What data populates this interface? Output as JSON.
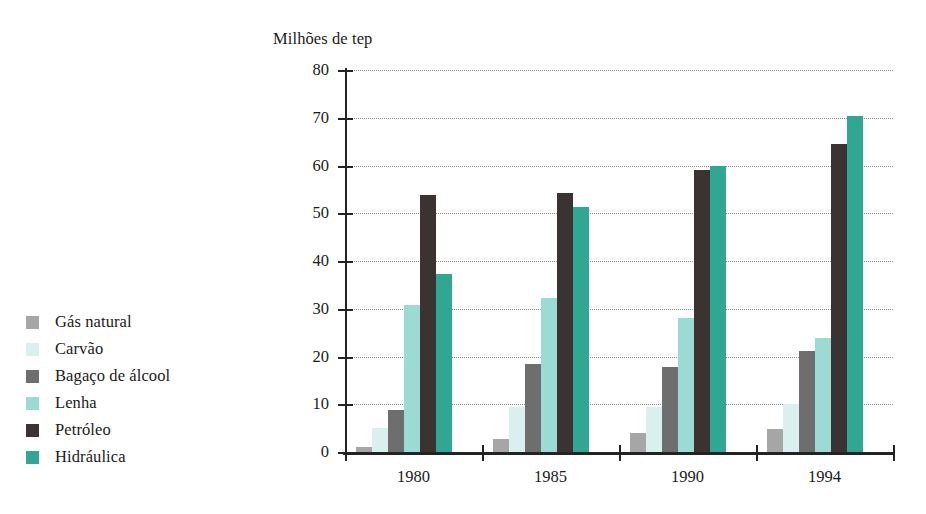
{
  "chart_data": {
    "type": "bar",
    "title": "Milhões de tep",
    "xlabel": "",
    "ylabel": "Milhões de tep",
    "categories": [
      "1980",
      "1985",
      "1990",
      "1994"
    ],
    "ylim": [
      0,
      80
    ],
    "yticks": [
      0,
      10,
      20,
      30,
      40,
      50,
      60,
      70,
      80
    ],
    "ytick_labels": [
      "0",
      "10",
      "20",
      "30",
      "40",
      "50",
      "60",
      "70",
      "80"
    ],
    "grid": true,
    "legend_position": "left",
    "series": [
      {
        "name": "Gás natural",
        "color": "#a6a6a6",
        "values": [
          1.0,
          2.7,
          4.0,
          4.8
        ]
      },
      {
        "name": "Carvão",
        "color": "#d9f0ef",
        "values": [
          5.0,
          9.5,
          9.5,
          10.0
        ]
      },
      {
        "name": "Bagaço de álcool",
        "color": "#6e6e6e",
        "values": [
          8.9,
          18.5,
          17.8,
          21.2
        ]
      },
      {
        "name": "Lenha",
        "color": "#9cdbd3",
        "values": [
          30.8,
          32.3,
          28.0,
          23.8
        ]
      },
      {
        "name": "Petróleo",
        "color": "#3a3331",
        "values": [
          53.8,
          54.2,
          59.0,
          64.5
        ]
      },
      {
        "name": "Hidráulica",
        "color": "#2fa793",
        "values": [
          37.2,
          51.3,
          59.8,
          70.4
        ]
      }
    ]
  },
  "axis_title": "Milhões de tep",
  "legend": {
    "items": [
      {
        "label": "Gás natural",
        "color": "#a6a6a6"
      },
      {
        "label": "Carvão",
        "color": "#d9f0ef"
      },
      {
        "label": "Bagaço de álcool",
        "color": "#6e6e6e"
      },
      {
        "label": "Lenha",
        "color": "#9cdbd3"
      },
      {
        "label": "Petróleo",
        "color": "#3a3331"
      },
      {
        "label": "Hidráulica",
        "color": "#2fa793"
      }
    ]
  }
}
